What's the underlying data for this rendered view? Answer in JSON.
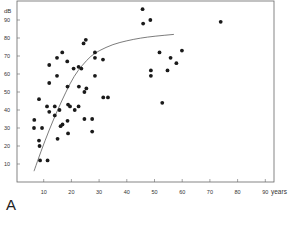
{
  "figure": {
    "panel_label": "A"
  },
  "chart_data": {
    "type": "scatter",
    "title": "",
    "xlabel": "years",
    "ylabel": "dB",
    "xlim": [
      0,
      92
    ],
    "ylim": [
      0,
      100
    ],
    "x_ticks": [
      10,
      20,
      30,
      40,
      50,
      60,
      70,
      80,
      90
    ],
    "y_ticks": [
      10,
      20,
      30,
      40,
      50,
      60,
      70,
      80,
      90
    ],
    "grid": false,
    "legend": null,
    "series": [
      {
        "name": "observations",
        "type": "scatter",
        "points": [
          [
            6.6,
            34.5
          ],
          [
            6.5,
            30
          ],
          [
            8.3,
            46
          ],
          [
            8.3,
            23
          ],
          [
            8.5,
            20
          ],
          [
            8.7,
            12
          ],
          [
            9.4,
            30
          ],
          [
            11.2,
            42
          ],
          [
            11.4,
            12
          ],
          [
            12,
            65
          ],
          [
            12,
            55
          ],
          [
            12,
            39
          ],
          [
            14,
            42
          ],
          [
            14,
            37
          ],
          [
            14.8,
            69
          ],
          [
            14.8,
            59
          ],
          [
            15,
            24
          ],
          [
            15.7,
            40
          ],
          [
            16.1,
            31
          ],
          [
            16.7,
            72
          ],
          [
            16.8,
            32
          ],
          [
            18.5,
            67
          ],
          [
            18.6,
            53
          ],
          [
            18.8,
            43
          ],
          [
            18.6,
            34
          ],
          [
            18.8,
            27
          ],
          [
            19.5,
            42
          ],
          [
            20.8,
            63
          ],
          [
            21.2,
            40
          ],
          [
            22.6,
            64
          ],
          [
            22.7,
            53
          ],
          [
            22.6,
            42
          ],
          [
            23.6,
            63
          ],
          [
            24.4,
            77
          ],
          [
            25.2,
            79
          ],
          [
            24.7,
            50
          ],
          [
            25.4,
            52
          ],
          [
            24.7,
            35
          ],
          [
            27.5,
            35
          ],
          [
            27.5,
            28
          ],
          [
            28.5,
            72
          ],
          [
            28.5,
            69
          ],
          [
            28.5,
            59
          ],
          [
            31.4,
            68
          ],
          [
            31.5,
            47
          ],
          [
            33.2,
            47
          ],
          [
            45.7,
            96
          ],
          [
            45.9,
            88
          ],
          [
            48.5,
            90
          ],
          [
            48.7,
            62
          ],
          [
            48.7,
            59
          ],
          [
            51.8,
            72
          ],
          [
            52.8,
            44
          ],
          [
            54.7,
            62
          ],
          [
            55.8,
            69
          ],
          [
            57.9,
            66
          ],
          [
            59.9,
            73
          ],
          [
            73.9,
            89
          ]
        ]
      },
      {
        "name": "fitted curve",
        "type": "line",
        "points": [
          [
            6.5,
            6
          ],
          [
            9,
            17
          ],
          [
            12,
            29
          ],
          [
            15,
            40
          ],
          [
            18,
            50
          ],
          [
            21,
            59
          ],
          [
            24,
            65
          ],
          [
            27,
            70
          ],
          [
            30,
            73
          ],
          [
            35,
            76.5
          ],
          [
            40,
            78.5
          ],
          [
            45,
            80
          ],
          [
            50,
            81
          ],
          [
            57,
            82
          ]
        ]
      }
    ]
  }
}
